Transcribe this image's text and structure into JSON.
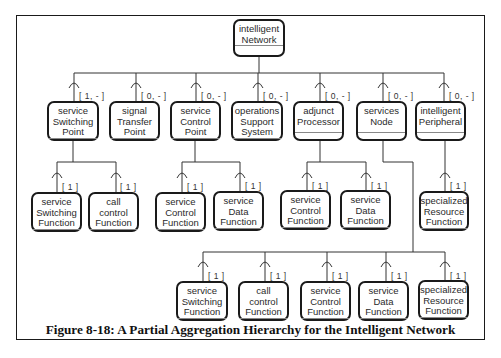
{
  "caption": "Figure 8-18: A Partial Aggregation Hierarchy for the Intelligent Network",
  "root": {
    "name": "intelligent\nNetwork"
  },
  "level1": [
    {
      "name": "service\nSwitching\nPoint",
      "mult": "[ 1, - ]"
    },
    {
      "name": "signal\nTransfer\nPoint",
      "mult": "[ 0, - ]"
    },
    {
      "name": "service\nControl\nPoint",
      "mult": "[ 0, - ]"
    },
    {
      "name": "operations\nSupport\nSystem",
      "mult": "[ 0, - ]"
    },
    {
      "name": "adjunct\nProcessor",
      "mult": "[ 0, - ]"
    },
    {
      "name": "services\nNode",
      "mult": "[ 0, - ]"
    },
    {
      "name": "intelligent\nPeripheral",
      "mult": "[ 0, - ]"
    }
  ],
  "ssp_children": [
    {
      "name": "service\nSwitching\nFunction",
      "mult": "[ 1 ]"
    },
    {
      "name": "call\ncontrol\nFunction",
      "mult": "[ 1 ]"
    }
  ],
  "scp_children": [
    {
      "name": "service\nControl\nFunction",
      "mult": "[ 1 ]"
    },
    {
      "name": "service\nData\nFunction",
      "mult": "[ 1 ]"
    }
  ],
  "ap_children": [
    {
      "name": "service\nControl\nFunction",
      "mult": "[ 1 ]"
    },
    {
      "name": "service\nData\nFunction",
      "mult": "[ 1 ]"
    }
  ],
  "ip_children": [
    {
      "name": "specialized\nResource\nFunction",
      "mult": "[ 1 ]"
    }
  ],
  "sn_children": [
    {
      "name": "service\nSwitching\nFunction",
      "mult": "[ 1 ]"
    },
    {
      "name": "call\ncontrol\nFunction",
      "mult": "[ 1 ]"
    },
    {
      "name": "service\nControl\nFunction",
      "mult": "[ 1 ]"
    },
    {
      "name": "service\nData\nFunction",
      "mult": "[ 1 ]"
    },
    {
      "name": "specialized\nResource\nFunction",
      "mult": "[ 1 ]"
    }
  ]
}
